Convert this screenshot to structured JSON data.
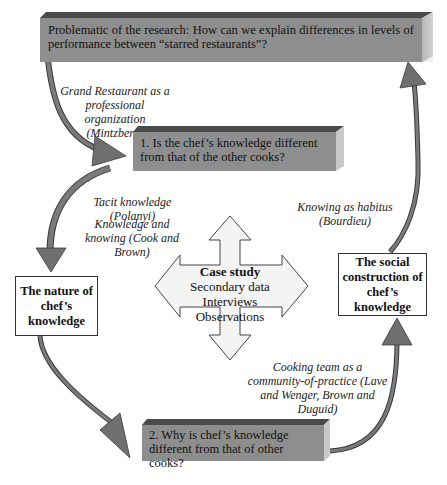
{
  "diagram": {
    "problem_box": {
      "text": "Problematic of the research: How can we explain differences in levels of performance between “starred restaurants”?"
    },
    "question1_box": {
      "text": "1. Is the chef’s knowledge different from that of the other cooks?"
    },
    "question2_box": {
      "text": "2. Why is chef’s knowledge different from that of other cooks?"
    },
    "nature_box": {
      "text": "The nature of chef’s knowledge"
    },
    "social_box": {
      "text": "The social construction of chef’s knowledge"
    },
    "case_study": {
      "title": "Case study",
      "items": [
        "Secondary data",
        "Interviews",
        "Observations"
      ]
    },
    "labels": {
      "grand_restaurant": "Grand Restaurant as a professional organization (Mintzberg)",
      "tacit": "Tacit knowledge (Polanyi)",
      "knowing": "Knowledge and knowing (Cook and Brown)",
      "habitus": "Knowing as habitus (Bourdieu)",
      "community": "Cooking team as a community-of-practice (Lave and Wenger, Brown and Duguid)"
    },
    "colors": {
      "box_front": "#8e8e8e",
      "box_top": "#4a4a4a",
      "box_side": "#b5b5b5",
      "arrow": "#6f6f6f",
      "arrow_edge": "#3a3a3a"
    }
  }
}
